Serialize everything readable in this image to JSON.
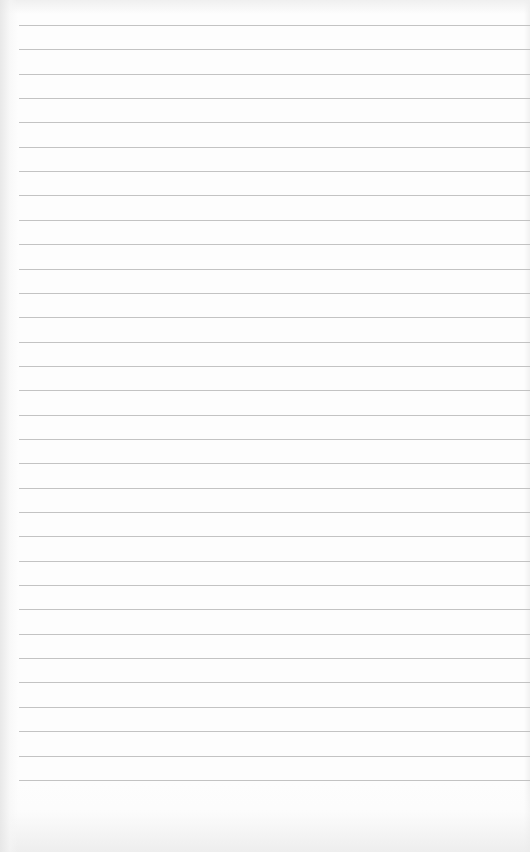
{
  "page": {
    "type": "lined-paper",
    "background_color": "#fdfdfd",
    "line_color": "#b9b9b9",
    "line_count": 32,
    "first_line_y": 25,
    "line_spacing": 24.35,
    "line_left_margin": 19
  }
}
